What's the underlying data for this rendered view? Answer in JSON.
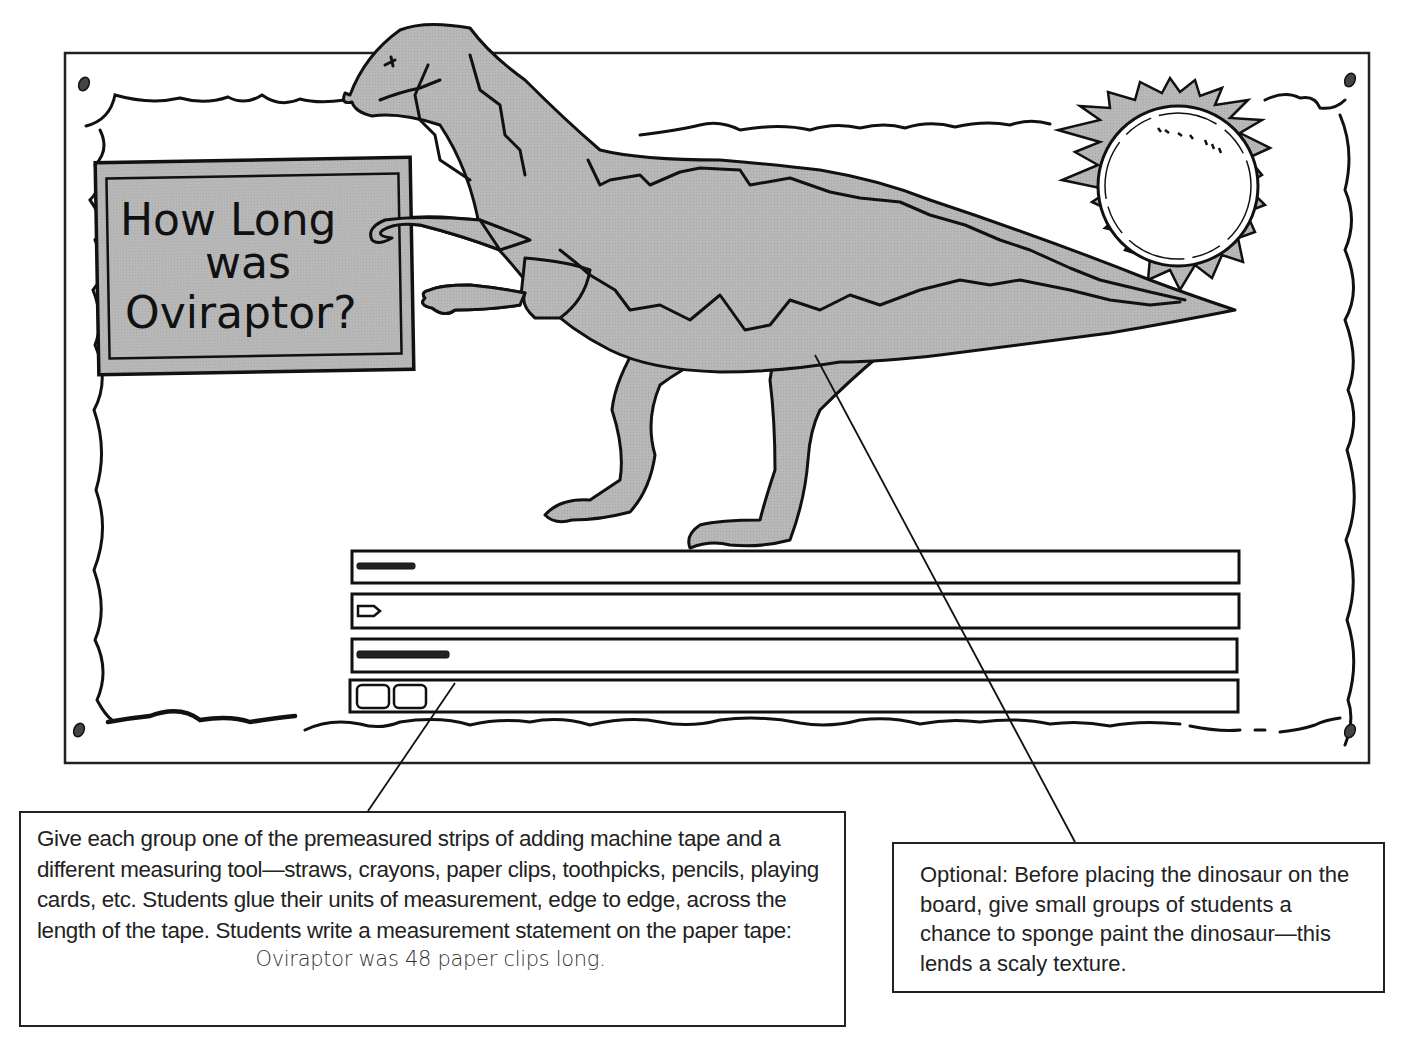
{
  "bulletin_board": {
    "sign": {
      "line1": "How Long",
      "line2": "was",
      "line3": "Oviraptor?"
    },
    "figures": {
      "dinosaur": "oviraptor-illustration",
      "sun": "sun-illustration",
      "frame": "scalloped-border",
      "pushpins": 4
    },
    "measurement_strips": [
      {
        "unit": "straws",
        "icon": "straw-icon"
      },
      {
        "unit": "crayons",
        "icon": "crayon-icon"
      },
      {
        "unit": "paper clips",
        "icon": "paper-clip-chain-icon"
      },
      {
        "unit": "playing cards",
        "icon": "card-icon"
      }
    ],
    "colors": {
      "fill_gray": "#b3b3b3",
      "line": "#111111",
      "paper": "#ffffff"
    }
  },
  "callouts": {
    "left": {
      "text": "Give each group one of the premeasured strips of adding machine tape and a different measuring tool—straws, crayons, paper clips, toothpicks, pencils, playing cards, etc. Students glue their units of measurement, edge to edge, across the length of the tape. Students write a measurement statement on the paper tape:",
      "example": "Oviraptor was 48 paper clips long."
    },
    "right": {
      "text": "Optional: Before placing the dinosaur on the board, give small groups of students a chance to sponge paint the dinosaur—this lends a scaly texture."
    }
  }
}
